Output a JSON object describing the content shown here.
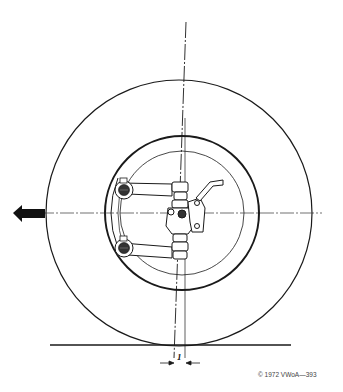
{
  "diagram": {
    "dimension_label": "1",
    "caption": "© 1972 VWoA—393",
    "direction_arrow": "left",
    "colors": {
      "line": "#1a1a1a",
      "background": "#ffffff"
    }
  }
}
